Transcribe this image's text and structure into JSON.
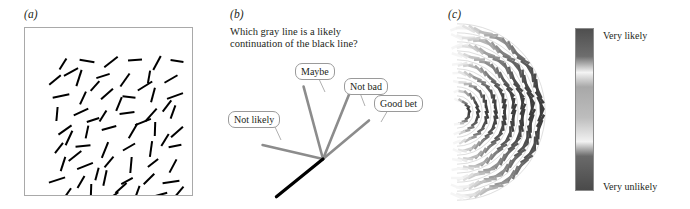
{
  "figure": {
    "panels": [
      {
        "id": "a",
        "label": "(a)",
        "kind": "random-line-field",
        "description": "Square field of randomly oriented black line segments"
      },
      {
        "id": "b",
        "label": "(b)",
        "kind": "continuation-fan",
        "question": "Which gray line is a likely continuation of the black line?",
        "question_line_1": "Which gray line is a likely",
        "question_line_2": "continuation of the black line?",
        "callouts": [
          {
            "label": "Not likely",
            "name": "callout-not-likely"
          },
          {
            "label": "Maybe",
            "name": "callout-maybe"
          },
          {
            "label": "Not bad",
            "name": "callout-not-bad"
          },
          {
            "label": "Good bet",
            "name": "callout-good-bet"
          }
        ]
      },
      {
        "id": "c",
        "label": "(c)",
        "kind": "polar-likelihood-map",
        "colorbar": {
          "top_label": "Very likely",
          "bottom_label": "Very unlikely"
        }
      }
    ]
  },
  "colors": {
    "black_line": "#000000",
    "gray_line": "#8c8c8c",
    "callout_border": "#9a9a9a",
    "frame_border": "#a9a9a9",
    "text": "#231f20",
    "colorbar_dark": "#4a4a4a",
    "colorbar_light": "#f2f2f2",
    "colorbar_mid": "#9c9c9c"
  },
  "chart_data": {
    "type": "scatter",
    "title": "",
    "panel_a_segments": [
      [
        38,
        36,
        -58
      ],
      [
        62,
        33,
        10
      ],
      [
        86,
        34,
        -38
      ],
      [
        110,
        32,
        -5
      ],
      [
        132,
        35,
        -62
      ],
      [
        152,
        33,
        8
      ],
      [
        30,
        52,
        -40
      ],
      [
        54,
        50,
        -72
      ],
      [
        78,
        48,
        -18
      ],
      [
        100,
        52,
        -55
      ],
      [
        124,
        49,
        -80
      ],
      [
        146,
        51,
        -30
      ],
      [
        36,
        68,
        -12
      ],
      [
        58,
        70,
        -65
      ],
      [
        82,
        66,
        -42
      ],
      [
        104,
        69,
        6
      ],
      [
        128,
        67,
        -75
      ],
      [
        150,
        68,
        -20
      ],
      [
        32,
        86,
        -85
      ],
      [
        56,
        84,
        -25
      ],
      [
        78,
        88,
        -58
      ],
      [
        102,
        85,
        -8
      ],
      [
        126,
        87,
        -48
      ],
      [
        148,
        84,
        -70
      ],
      [
        40,
        102,
        -35
      ],
      [
        62,
        104,
        -78
      ],
      [
        84,
        100,
        -15
      ],
      [
        108,
        103,
        -60
      ],
      [
        130,
        101,
        -88
      ],
      [
        152,
        104,
        -42
      ],
      [
        34,
        120,
        -52
      ],
      [
        58,
        118,
        -5
      ],
      [
        80,
        122,
        -68
      ],
      [
        104,
        119,
        -30
      ],
      [
        126,
        121,
        -82
      ],
      [
        150,
        118,
        -12
      ],
      [
        38,
        136,
        -72
      ],
      [
        60,
        138,
        -22
      ],
      [
        84,
        134,
        -50
      ],
      [
        106,
        137,
        -85
      ],
      [
        128,
        135,
        -38
      ],
      [
        148,
        138,
        -62
      ],
      [
        32,
        152,
        -18
      ],
      [
        56,
        154,
        -60
      ],
      [
        80,
        150,
        -78
      ],
      [
        102,
        153,
        -28
      ],
      [
        124,
        151,
        -45
      ],
      [
        146,
        154,
        -8
      ],
      [
        42,
        166,
        -55
      ],
      [
        66,
        164,
        -88
      ],
      [
        88,
        168,
        -35
      ],
      [
        112,
        165,
        -70
      ],
      [
        134,
        167,
        -15
      ],
      [
        154,
        164,
        -50
      ],
      [
        46,
        44,
        -28
      ],
      [
        70,
        58,
        -48
      ],
      [
        94,
        76,
        -68
      ],
      [
        118,
        94,
        -22
      ],
      [
        140,
        112,
        -58
      ],
      [
        50,
        128,
        -38
      ],
      [
        72,
        146,
        -75
      ],
      [
        96,
        160,
        -42
      ],
      [
        120,
        58,
        -32
      ],
      [
        142,
        78,
        -52
      ],
      [
        44,
        110,
        -65
      ],
      [
        68,
        92,
        -18
      ]
    ],
    "panel_b_rays": [
      {
        "label": "Not likely",
        "angle_deg": 167,
        "length": 62,
        "color": "#8c8c8c"
      },
      {
        "label": "Maybe",
        "angle_deg": 105,
        "length": 75,
        "color": "#8c8c8c"
      },
      {
        "label": "Not bad",
        "angle_deg": 68,
        "length": 70,
        "color": "#8c8c8c"
      },
      {
        "label": "Good bet",
        "angle_deg": 40,
        "length": 60,
        "color": "#8c8c8c"
      },
      {
        "label": "black line",
        "angle_deg": -141,
        "length": 60,
        "color": "#000000"
      }
    ],
    "panel_c_rings": [
      {
        "ring": 1,
        "radius": 12,
        "marks": 10
      },
      {
        "ring": 2,
        "radius": 21,
        "marks": 14
      },
      {
        "ring": 3,
        "radius": 30,
        "marks": 18
      },
      {
        "ring": 4,
        "radius": 39,
        "marks": 24
      },
      {
        "ring": 5,
        "radius": 48,
        "marks": 28
      },
      {
        "ring": 6,
        "radius": 57,
        "marks": 32
      },
      {
        "ring": 7,
        "radius": 66,
        "marks": 38
      },
      {
        "ring": 8,
        "radius": 75,
        "marks": 42
      },
      {
        "ring": 9,
        "radius": 84,
        "marks": 46
      }
    ],
    "panel_c_colorbar_stops": [
      {
        "pos": 0.0,
        "color": "#4f4f4f"
      },
      {
        "pos": 0.17,
        "color": "#6e6e6e"
      },
      {
        "pos": 0.27,
        "color": "#f4f4f4"
      },
      {
        "pos": 0.36,
        "color": "#a8a8a8"
      },
      {
        "pos": 0.55,
        "color": "#bdbdbd"
      },
      {
        "pos": 0.7,
        "color": "#f2f2f2"
      },
      {
        "pos": 0.79,
        "color": "#6a6a6a"
      },
      {
        "pos": 1.0,
        "color": "#4a4a4a"
      }
    ],
    "xlabel": "",
    "ylabel": "",
    "legend": [
      "Very likely",
      "Very unlikely"
    ]
  }
}
